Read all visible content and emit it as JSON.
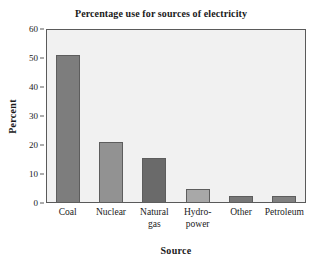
{
  "chart_data": {
    "type": "bar",
    "title": "Percentage use for sources of electricity",
    "xlabel": "Source",
    "ylabel": "Percent",
    "categories": [
      "Coal",
      "Nuclear",
      "Natural gas",
      "Hydro-power",
      "Other",
      "Petroleum"
    ],
    "category_lines": [
      [
        "Coal",
        ""
      ],
      [
        "Nuclear",
        ""
      ],
      [
        "Natural",
        "gas"
      ],
      [
        "Hydro-",
        "power"
      ],
      [
        "Other",
        ""
      ],
      [
        "Petroleum",
        ""
      ]
    ],
    "values": [
      51,
      21,
      15.5,
      5,
      2.5,
      2.5
    ],
    "bar_colors": [
      "#7d7d7d",
      "#929292",
      "#6a6a6a",
      "#a8a8a8",
      "#777777",
      "#808080"
    ],
    "ylim": [
      0,
      60
    ],
    "yticks": [
      0,
      10,
      20,
      30,
      40,
      50,
      60
    ],
    "ytick_labels": [
      "0",
      "10",
      "20",
      "30",
      "40",
      "50",
      "60"
    ],
    "xlim_categories": 6,
    "grid": false,
    "legend": "none",
    "plot_background": "#f1f1f1",
    "axis_color": "#5a5a5a"
  }
}
